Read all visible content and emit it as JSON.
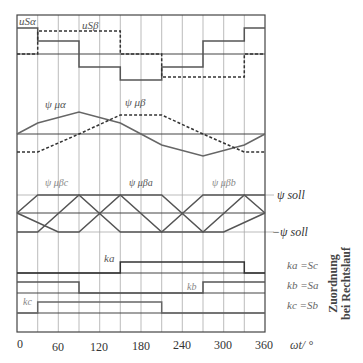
{
  "diagram": {
    "x_axis": {
      "label": "ωt/ °",
      "ticks": [
        "0",
        "60",
        "120",
        "180",
        "240",
        "300",
        "360"
      ]
    },
    "panels": {
      "voltage": {
        "labels": {
          "u_alpha": "uSα",
          "u_beta": "uSβ"
        }
      },
      "flux": {
        "labels": {
          "psi_alpha": "ψ μα",
          "psi_beta": "ψ μβ"
        }
      },
      "flux_phase": {
        "labels": {
          "psi_c": "ψ μβc",
          "psi_a": "ψ μβa",
          "psi_b": "ψ μβb"
        },
        "ref_labels": {
          "pos": "ψ soll",
          "neg": "−ψ soll"
        }
      },
      "switching": {
        "labels": {
          "k_a": "ka",
          "k_b": "kb",
          "k_c": "kc"
        },
        "assignments": [
          "ka =Sc",
          "kb =Sa",
          "kc =Sb"
        ],
        "assignment_title_line1": "Zuordnung",
        "assignment_title_line2": "bei Rechtslauf"
      }
    },
    "colors": {
      "line": "#555555",
      "grid": "#999999",
      "frame": "#444444"
    }
  }
}
